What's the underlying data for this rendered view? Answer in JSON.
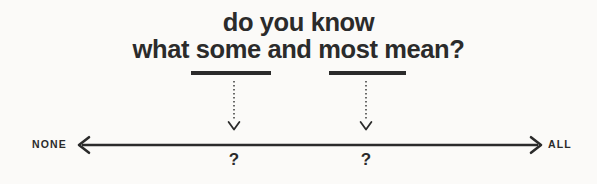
{
  "canvas": {
    "background_color": "#fbfaf8",
    "ink_color": "#2b2b2b",
    "width": 597,
    "height": 184
  },
  "title": {
    "line1": "do you know",
    "line2": "what some and most mean?",
    "emphasized_words": [
      "some",
      "most"
    ]
  },
  "scale": {
    "left_label": "NONE",
    "right_label": "ALL",
    "axis_style": "double-headed-arrow"
  },
  "markers": [
    {
      "word": "some",
      "connector_icon": "dotted-down-arrow-icon",
      "value_label": "?"
    },
    {
      "word": "most",
      "connector_icon": "dotted-down-arrow-icon",
      "value_label": "?"
    }
  ]
}
